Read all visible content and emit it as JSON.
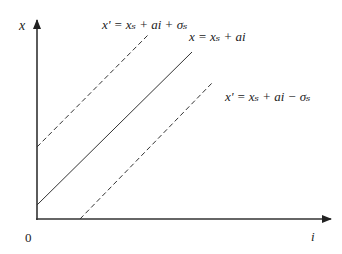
{
  "diagram": {
    "axes": {
      "y_label": "x",
      "x_label": "i",
      "origin_label": "0"
    },
    "lines": [
      {
        "name": "upper-bound",
        "style": "dashed",
        "equation": "x' = xₛ + ai + σₛ"
      },
      {
        "name": "center",
        "style": "solid",
        "equation": "x = xₛ + ai"
      },
      {
        "name": "lower-bound",
        "style": "dashed",
        "equation": "x' = xₛ + ai − σₛ"
      }
    ],
    "colors": {
      "line": "#333333",
      "axis": "#333333",
      "background": "#ffffff"
    }
  }
}
